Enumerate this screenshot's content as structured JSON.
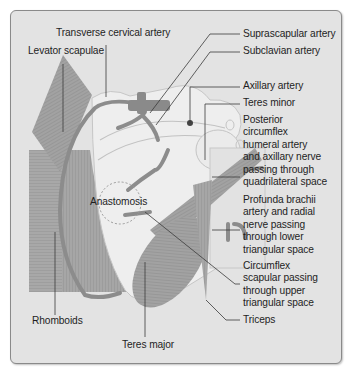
{
  "diagram": {
    "labels": {
      "transverse_cervical": "Transverse cervical artery",
      "levator_scapulae": "Levator scapulae",
      "suprascapular": "Suprascapular artery",
      "subclavian": "Subclavian artery",
      "axillary": "Axillary artery",
      "teres_minor": "Teres minor",
      "posterior_circumflex": [
        "Posterior",
        "circumflex",
        "humeral artery",
        "and axillary nerve",
        "passing through",
        "quadrilateral space"
      ],
      "profunda": [
        "Profunda brachii",
        "artery and radial",
        "nerve passing",
        "through lower",
        "triangular space"
      ],
      "circumflex_scapular": [
        "Circumflex",
        "scapular passing",
        "through upper",
        "triangular space"
      ],
      "triceps": "Triceps",
      "anastomosis": "Anastomosis",
      "rhomboids": "Rhomboids",
      "teres_major": "Teres major"
    },
    "colors": {
      "background": "#e3e3e3",
      "muscle": "#9a9a9a",
      "artery": "#8c8c8c",
      "scapula": "#eeeeee",
      "leader": "#3a3a3a",
      "text": "#1e1e1e"
    }
  }
}
